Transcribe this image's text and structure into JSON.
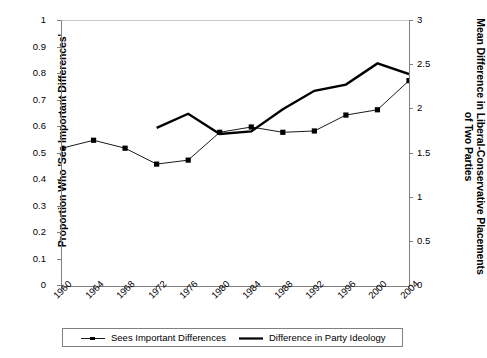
{
  "chart_data": {
    "type": "line",
    "title": "",
    "xlabel": "",
    "ylabel": "Proportion Who 'See Important Differences'",
    "ylabel_right": "Mean Difference in Liberal-Conservative Placements of Two Parties",
    "x": [
      1960,
      1964,
      1968,
      1972,
      1976,
      1980,
      1984,
      1988,
      1992,
      1996,
      2000,
      2004
    ],
    "xlim": [
      1960,
      2004
    ],
    "ylim": [
      0,
      1
    ],
    "ylim_right": [
      0,
      3
    ],
    "yticks": [
      "0",
      "0.1",
      "0.2",
      "0.3",
      "0.4",
      "0.5",
      "0.6",
      "0.7",
      "0.8",
      "0.9",
      "1"
    ],
    "ytick_values": [
      0,
      0.1,
      0.2,
      0.3,
      0.4,
      0.5,
      0.6,
      0.7,
      0.8,
      0.9,
      1
    ],
    "yticks_right": [
      "0",
      "0.5",
      "1",
      "1.5",
      "2",
      "2.5",
      "3"
    ],
    "ytick_values_right": [
      0,
      0.5,
      1,
      1.5,
      2,
      2.5,
      3
    ],
    "xticks": [
      "1960",
      "1964",
      "1968",
      "1972",
      "1976",
      "1980",
      "1984",
      "1988",
      "1992",
      "1996",
      "2000",
      "2004"
    ],
    "grid": false,
    "legend_position": "bottom",
    "series": [
      {
        "name": "Sees Important Differences",
        "axis": "left",
        "marker": "square",
        "linewidth": "thin",
        "color": "#000000",
        "x": [
          1960,
          1964,
          1968,
          1972,
          1976,
          1980,
          1984,
          1988,
          1992,
          1996,
          2000,
          2004
        ],
        "values": [
          0.52,
          0.55,
          0.52,
          0.46,
          0.475,
          0.58,
          0.6,
          0.58,
          0.585,
          0.645,
          0.665,
          0.775
        ]
      },
      {
        "name": "Difference in Party Ideology",
        "axis": "right",
        "marker": "none",
        "linewidth": "thick",
        "color": "#000000",
        "x": [
          1972,
          1976,
          1980,
          1984,
          1988,
          1992,
          1996,
          2000,
          2004
        ],
        "values": [
          1.79,
          1.95,
          1.72,
          1.75,
          2.0,
          2.21,
          2.28,
          2.52,
          2.4
        ]
      }
    ]
  },
  "legend": {
    "entries": [
      {
        "label": "Sees Important Differences",
        "symbol": "line-with-square-marker"
      },
      {
        "label": "Difference in Party Ideology",
        "symbol": "thick-line"
      }
    ]
  }
}
